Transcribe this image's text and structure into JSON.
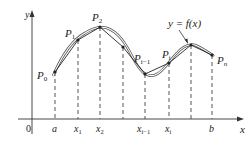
{
  "diagram": {
    "axes": {
      "x_label": "x",
      "y_label": "y",
      "origin_label": "0"
    },
    "curve_label": "y = f(x)",
    "points": [
      {
        "name": "P",
        "sub": "0",
        "x": 55,
        "y": 72
      },
      {
        "name": "P",
        "sub": "1",
        "x": 78,
        "y": 40
      },
      {
        "name": "P",
        "sub": "2",
        "x": 100,
        "y": 27
      },
      {
        "name": "",
        "sub": "",
        "x": 123,
        "y": 47
      },
      {
        "name": "P",
        "sub": "i−1",
        "x": 145,
        "y": 74
      },
      {
        "name": "P",
        "sub": "i",
        "x": 169,
        "y": 63
      },
      {
        "name": "",
        "sub": "",
        "x": 191,
        "y": 45
      },
      {
        "name": "P",
        "sub": "n",
        "x": 212,
        "y": 55
      }
    ],
    "x_ticks": [
      {
        "label": "a",
        "sub": ""
      },
      {
        "label": "x",
        "sub": "1"
      },
      {
        "label": "x",
        "sub": "2"
      },
      {
        "label": "x",
        "sub": "i−1"
      },
      {
        "label": "x",
        "sub": "i"
      },
      {
        "label": "b",
        "sub": ""
      }
    ]
  }
}
